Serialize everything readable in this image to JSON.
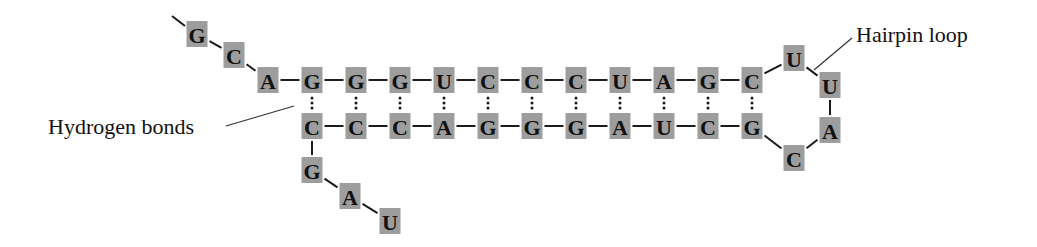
{
  "diagram": {
    "type": "RNA hairpin structure",
    "labels": {
      "hairpin_loop": "Hairpin loop",
      "hydrogen_bonds": "Hydrogen bonds"
    },
    "colors": {
      "nucleotide_box": "#9d9d9d",
      "text": "#111111",
      "bond": "#1a1a1a"
    },
    "five_prime_tail": [
      "G",
      "C",
      "A"
    ],
    "stem_top": [
      "G",
      "G",
      "G",
      "U",
      "C",
      "C",
      "C",
      "U",
      "A",
      "G",
      "C"
    ],
    "loop": [
      "U",
      "U",
      "A",
      "C"
    ],
    "stem_bottom": [
      "C",
      "C",
      "C",
      "A",
      "G",
      "G",
      "G",
      "A",
      "U",
      "C",
      "G"
    ],
    "three_prime_tail": [
      "G",
      "A",
      "U"
    ],
    "base_pairs": [
      [
        "G",
        "C"
      ],
      [
        "G",
        "C"
      ],
      [
        "G",
        "C"
      ],
      [
        "U",
        "A"
      ],
      [
        "C",
        "G"
      ],
      [
        "C",
        "G"
      ],
      [
        "C",
        "G"
      ],
      [
        "U",
        "A"
      ],
      [
        "A",
        "U"
      ],
      [
        "G",
        "C"
      ],
      [
        "C",
        "G"
      ]
    ]
  }
}
